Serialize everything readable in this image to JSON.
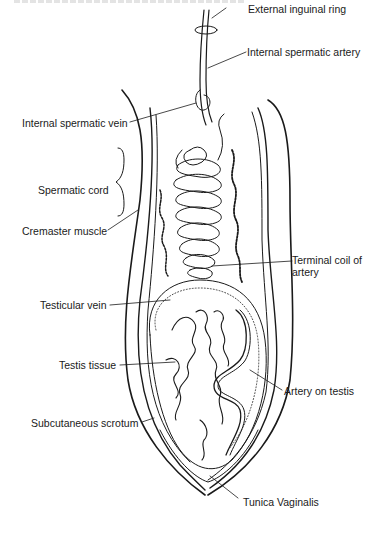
{
  "figure": {
    "type": "anatomical-diagram",
    "labels": [
      {
        "id": "external-inguinal-ring",
        "text": "External inguinal ring",
        "side": "right"
      },
      {
        "id": "internal-spermatic-artery",
        "text": "Internal spermatic artery",
        "side": "right"
      },
      {
        "id": "internal-spermatic-vein",
        "text": "Internal spermatic vein",
        "side": "left"
      },
      {
        "id": "spermatic-cord",
        "text": "Spermatic cord",
        "side": "left"
      },
      {
        "id": "cremaster-muscle",
        "text": "Cremaster muscle",
        "side": "left"
      },
      {
        "id": "terminal-coil-of-artery",
        "text": "Terminal coil of artery",
        "side": "right"
      },
      {
        "id": "testicular-vein",
        "text": "Testicular vein",
        "side": "left"
      },
      {
        "id": "testis-tissue",
        "text": "Testis tissue",
        "side": "left"
      },
      {
        "id": "artery-on-testis",
        "text": "Artery on testis",
        "side": "right"
      },
      {
        "id": "subcutaneous-scrotum",
        "text": "Subcutaneous  scrotum",
        "side": "left"
      },
      {
        "id": "tunica-vaginalis",
        "text": "Tunica Vaginalis",
        "side": "bottom"
      }
    ]
  }
}
